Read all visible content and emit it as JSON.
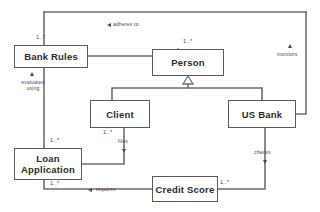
{
  "diagram": {
    "type": "uml-class-diagram",
    "width": 320,
    "height": 212,
    "background_color": "#ffffff",
    "line_color": "#6e6e6e",
    "box_border_color": "#5a5a5a",
    "text_color": "#2b2b2b"
  },
  "classes": [
    {
      "id": "bank_rules",
      "name": "Bank Rules",
      "x": 14,
      "y": 45,
      "w": 74,
      "h": 23
    },
    {
      "id": "person",
      "name": "Person",
      "x": 152,
      "y": 49,
      "w": 72,
      "h": 27
    },
    {
      "id": "client",
      "name": "Client",
      "x": 90,
      "y": 100,
      "w": 60,
      "h": 28
    },
    {
      "id": "us_bank",
      "name": "US Bank",
      "x": 228,
      "y": 100,
      "w": 68,
      "h": 28
    },
    {
      "id": "loan_application",
      "name": "Loan\nApplication",
      "x": 14,
      "y": 148,
      "w": 68,
      "h": 32
    },
    {
      "id": "credit_score",
      "name": "Credit Score",
      "x": 152,
      "y": 176,
      "w": 66,
      "h": 26
    }
  ],
  "associations": [
    {
      "id": "adheres_to",
      "label": "adheres to",
      "source": "person",
      "target": "bank_rules",
      "arrow": "left",
      "label_x": 113,
      "label_y": 22,
      "arrow_x": 107,
      "arrow_y": 23
    },
    {
      "id": "evaluated_using",
      "label": "evaluated\nusing",
      "source": "loan_application",
      "target": "bank_rules",
      "arrow": "up",
      "label_x": 16,
      "label_y": 79,
      "arrow_x": 30,
      "arrow_y": 72
    },
    {
      "id": "monitors",
      "label": "monitors",
      "source": "us_bank",
      "target": "bank_rules",
      "arrow": "up",
      "label_x": 277,
      "label_y": 51,
      "arrow_x": 288,
      "arrow_y": 44
    },
    {
      "id": "files",
      "label": "files",
      "source": "client",
      "target": "loan_application",
      "arrow": "down",
      "label_x": 119,
      "label_y": 140,
      "arrow_x": 124,
      "arrow_y": 150
    },
    {
      "id": "checks",
      "label": "checks",
      "source": "us_bank",
      "target": "credit_score",
      "arrow": "down",
      "label_x": 255,
      "label_y": 150,
      "arrow_x": 265,
      "arrow_y": 159
    },
    {
      "id": "requires",
      "label": "requires",
      "source": "credit_score",
      "target": "loan_application",
      "arrow": "left",
      "label_x": 96,
      "label_y": 188,
      "arrow_x": 88,
      "arrow_y": 189
    }
  ],
  "generalizations": [
    {
      "id": "client_to_person",
      "source": "client",
      "target": "person"
    },
    {
      "id": "us_bank_to_person",
      "source": "us_bank",
      "target": "person"
    }
  ],
  "multiplicities": [
    {
      "id": "mult_bank_rules_top",
      "value": "1..*",
      "x": 36,
      "y": 34
    },
    {
      "id": "mult_person_top",
      "value": "1..*",
      "x": 183,
      "y": 38
    },
    {
      "id": "mult_client_bottom",
      "value": "1..*",
      "x": 103,
      "y": 128
    },
    {
      "id": "mult_loan_top",
      "value": "1..*",
      "x": 50,
      "y": 137
    },
    {
      "id": "mult_loan_bottom",
      "value": "1..*",
      "x": 50,
      "y": 180
    },
    {
      "id": "mult_credit_score_right",
      "value": "1..*",
      "x": 220,
      "y": 180
    }
  ]
}
